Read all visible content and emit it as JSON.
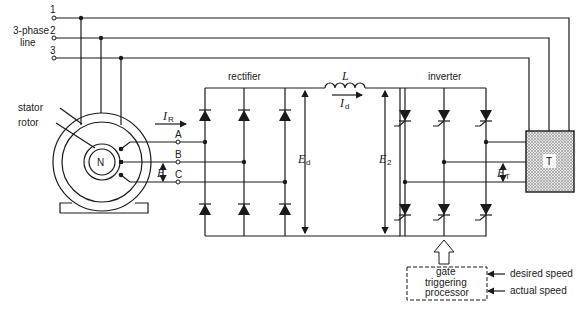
{
  "figure": {
    "supply": {
      "label_line1": "3-phase",
      "label_line2": "line",
      "phases": [
        "1",
        "2",
        "3"
      ]
    },
    "motor": {
      "stator_label": "stator",
      "rotor_label": "rotor",
      "rotor_pole": "N",
      "terminals": [
        "A",
        "B",
        "C"
      ],
      "voltage_label": "E"
    },
    "rectifier": {
      "label": "rectifier",
      "current_label": "I",
      "current_sub": "R",
      "dc_voltage_label": "E",
      "dc_voltage_sub": "d"
    },
    "dc_link": {
      "inductor_label": "L",
      "current_label": "I",
      "current_sub": "d",
      "voltage_label": "E",
      "voltage_sub": "2"
    },
    "inverter": {
      "label": "inverter",
      "output_voltage_label": "E",
      "output_voltage_sub": "T"
    },
    "transformer": {
      "label": "T"
    },
    "controller": {
      "label_lines": [
        "gate",
        "triggering",
        "processor"
      ],
      "inputs": [
        "desired speed",
        "actual speed"
      ]
    }
  }
}
